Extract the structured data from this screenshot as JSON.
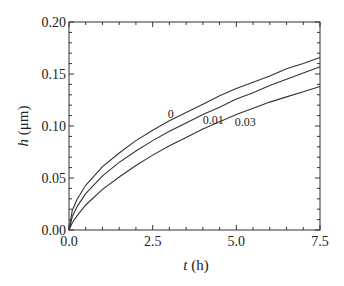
{
  "chart_data": {
    "type": "line",
    "title": "",
    "xlabel_var": "t",
    "xlabel_unit": " (h)",
    "ylabel_var": "h",
    "ylabel_unit": " (μm)",
    "xlim": [
      0,
      7.5
    ],
    "ylim": [
      0,
      0.2
    ],
    "x_ticks": [
      "0.0",
      "2.5",
      "5.0",
      "7.5"
    ],
    "y_ticks": [
      "0.00",
      "0.05",
      "0.10",
      "0.15",
      "0.20"
    ],
    "grid": false,
    "x": [
      0,
      0.1,
      0.25,
      0.5,
      1.0,
      1.5,
      2.0,
      2.5,
      3.0,
      3.5,
      4.0,
      4.5,
      5.0,
      5.5,
      6.0,
      6.5,
      7.0,
      7.5
    ],
    "series": [
      {
        "name": "0",
        "values": [
          0,
          0.019,
          0.03,
          0.043,
          0.061,
          0.074,
          0.086,
          0.096,
          0.105,
          0.113,
          0.121,
          0.129,
          0.136,
          0.142,
          0.148,
          0.155,
          0.16,
          0.166
        ]
      },
      {
        "name": "0.01",
        "values": [
          0,
          0.013,
          0.023,
          0.035,
          0.052,
          0.065,
          0.076,
          0.086,
          0.095,
          0.103,
          0.111,
          0.118,
          0.126,
          0.132,
          0.139,
          0.145,
          0.151,
          0.157
        ]
      },
      {
        "name": "0.03",
        "values": [
          0,
          0.007,
          0.014,
          0.024,
          0.039,
          0.051,
          0.062,
          0.072,
          0.081,
          0.089,
          0.097,
          0.104,
          0.111,
          0.117,
          0.123,
          0.128,
          0.133,
          0.138
        ]
      }
    ],
    "annotations": [
      {
        "text": "0",
        "x": 2.95,
        "y": 0.108
      },
      {
        "text": "0.01",
        "x": 4.0,
        "y": 0.102
      },
      {
        "text": "0.03",
        "x": 4.95,
        "y": 0.1
      }
    ]
  }
}
